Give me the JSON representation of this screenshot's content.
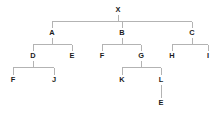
{
  "diagram": {
    "kind": "tree-diagram",
    "title": "",
    "background_color": "#ffffff",
    "edge_color": "#b3b3b3",
    "label_color": "#1b1b1b",
    "edge_style": "orthogonal-elbow",
    "levels": 5,
    "node_count": 16,
    "nodes": [
      {
        "id": "n0",
        "label": "X",
        "level": 0,
        "x": 118,
        "y": 10,
        "parent": null,
        "children": [
          "n1",
          "n2",
          "n3"
        ]
      },
      {
        "id": "n1",
        "label": "A",
        "level": 1,
        "x": 52,
        "y": 33,
        "parent": "n0",
        "children": [
          "n4",
          "n5"
        ]
      },
      {
        "id": "n2",
        "label": "B",
        "level": 1,
        "x": 122,
        "y": 33,
        "parent": "n0",
        "children": [
          "n6",
          "n7"
        ]
      },
      {
        "id": "n3",
        "label": "C",
        "level": 1,
        "x": 192,
        "y": 33,
        "parent": "n0",
        "children": [
          "n8",
          "n9"
        ]
      },
      {
        "id": "n4",
        "label": "D",
        "level": 2,
        "x": 33,
        "y": 56,
        "parent": "n1",
        "children": [
          "n10",
          "n11"
        ]
      },
      {
        "id": "n5",
        "label": "E",
        "level": 2,
        "x": 72,
        "y": 56,
        "parent": "n1",
        "children": []
      },
      {
        "id": "n6",
        "label": "F",
        "level": 2,
        "x": 102,
        "y": 56,
        "parent": "n2",
        "children": []
      },
      {
        "id": "n7",
        "label": "G",
        "level": 2,
        "x": 141,
        "y": 56,
        "parent": "n2",
        "children": [
          "n12",
          "n13"
        ]
      },
      {
        "id": "n8",
        "label": "H",
        "level": 2,
        "x": 172,
        "y": 56,
        "parent": "n3",
        "children": []
      },
      {
        "id": "n9",
        "label": "I",
        "level": 2,
        "x": 208,
        "y": 56,
        "parent": "n3",
        "children": []
      },
      {
        "id": "n10",
        "label": "F",
        "level": 3,
        "x": 13,
        "y": 80,
        "parent": "n4",
        "children": []
      },
      {
        "id": "n11",
        "label": "J",
        "level": 3,
        "x": 54,
        "y": 80,
        "parent": "n4",
        "children": []
      },
      {
        "id": "n12",
        "label": "K",
        "level": 3,
        "x": 122,
        "y": 80,
        "parent": "n7",
        "children": []
      },
      {
        "id": "n13",
        "label": "L",
        "level": 3,
        "x": 161,
        "y": 80,
        "parent": "n7",
        "children": [
          "n14"
        ]
      },
      {
        "id": "n14",
        "label": "E",
        "level": 4,
        "x": 161,
        "y": 103,
        "parent": "n13",
        "children": []
      }
    ],
    "edges": [
      {
        "from": "n0",
        "to": "n1"
      },
      {
        "from": "n0",
        "to": "n2"
      },
      {
        "from": "n0",
        "to": "n3"
      },
      {
        "from": "n1",
        "to": "n4"
      },
      {
        "from": "n1",
        "to": "n5"
      },
      {
        "from": "n2",
        "to": "n6"
      },
      {
        "from": "n2",
        "to": "n7"
      },
      {
        "from": "n3",
        "to": "n8"
      },
      {
        "from": "n3",
        "to": "n9"
      },
      {
        "from": "n4",
        "to": "n10"
      },
      {
        "from": "n4",
        "to": "n11"
      },
      {
        "from": "n7",
        "to": "n12"
      },
      {
        "from": "n7",
        "to": "n13"
      },
      {
        "from": "n13",
        "to": "n14"
      }
    ]
  }
}
